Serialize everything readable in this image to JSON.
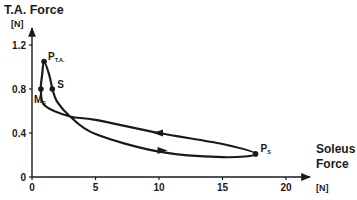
{
  "chart_data": {
    "type": "line",
    "title": "",
    "ylabel": "T.A. Force",
    "ylabel_unit": "[N]",
    "xlabel_line1": "Soleus",
    "xlabel_line2": "Force",
    "xlabel_unit": "[N]",
    "xlim": [
      0,
      21.5
    ],
    "ylim": [
      0,
      1.35
    ],
    "x_ticks": [
      0,
      5,
      10,
      15,
      20
    ],
    "x_tick_labels": [
      "0",
      "5",
      "10",
      "15",
      "20"
    ],
    "y_ticks": [
      0,
      0.4,
      0.8,
      1.2
    ],
    "y_tick_labels": [
      "0",
      "0.4",
      "0.8",
      "1.2"
    ],
    "grid": false,
    "legend": "none",
    "series": [
      {
        "name": "T.A.-Soleus force loop",
        "points": [
          {
            "x": 1.6,
            "y": 0.8
          },
          {
            "x": 1.35,
            "y": 0.93
          },
          {
            "x": 0.95,
            "y": 1.05
          },
          {
            "x": 0.8,
            "y": 0.93
          },
          {
            "x": 0.7,
            "y": 0.8
          },
          {
            "x": 1.0,
            "y": 0.65
          },
          {
            "x": 3.0,
            "y": 0.55
          },
          {
            "x": 5.0,
            "y": 0.52
          },
          {
            "x": 10.0,
            "y": 0.4
          },
          {
            "x": 15.0,
            "y": 0.3
          },
          {
            "x": 17.6,
            "y": 0.21
          },
          {
            "x": 15.0,
            "y": 0.18
          },
          {
            "x": 10.0,
            "y": 0.23
          },
          {
            "x": 5.0,
            "y": 0.39
          },
          {
            "x": 3.0,
            "y": 0.55
          },
          {
            "x": 2.0,
            "y": 0.68
          },
          {
            "x": 1.6,
            "y": 0.8
          }
        ]
      }
    ],
    "annotations": [
      {
        "label": "P",
        "sub": "T.A.",
        "x": 0.95,
        "y": 1.05
      },
      {
        "label": "S",
        "sub": "",
        "x": 1.6,
        "y": 0.8
      },
      {
        "label": "M",
        "sub": "S",
        "x": 0.7,
        "y": 0.8
      },
      {
        "label": "P",
        "sub": "S",
        "x": 17.6,
        "y": 0.21
      }
    ],
    "arrows": [
      {
        "direction": "left",
        "on": "upper branch",
        "x": 10.0,
        "y": 0.4
      },
      {
        "direction": "right",
        "on": "lower branch",
        "x": 10.2,
        "y": 0.24
      }
    ]
  },
  "colors": {
    "line": "#1a1a1a",
    "background": "#ffffff"
  }
}
